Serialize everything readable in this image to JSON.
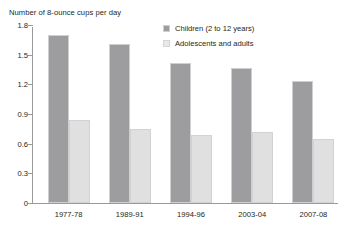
{
  "figure": {
    "cropped_title_remnant": "",
    "axis_title": "Number of 8-ounce cups per day"
  },
  "legend": {
    "position": "top-right",
    "items": [
      {
        "label": "Children (2 to 12 years)",
        "swatch": "legend-swatch-children",
        "color": "#9d9d9f"
      },
      {
        "label": "Adolescents and adults",
        "swatch": "legend-swatch-adolescents-adults",
        "color": "#e8e8e8"
      }
    ]
  },
  "chart_data": {
    "type": "bar",
    "title": "",
    "subtitle": "",
    "xlabel": "",
    "ylabel": "Number of 8-ounce cups per day",
    "categories": [
      "1977-78",
      "1989-91",
      "1994-96",
      "2003-04",
      "2007-08"
    ],
    "series": [
      {
        "name": "Children (2 to 12 years)",
        "color": "#9d9d9f",
        "values": [
          1.7,
          1.61,
          1.42,
          1.37,
          1.23
        ]
      },
      {
        "name": "Adolescents and adults",
        "color": "#e0e0e0",
        "values": [
          0.84,
          0.75,
          0.69,
          0.72,
          0.65
        ]
      }
    ],
    "ylim": [
      0,
      1.8
    ],
    "yticks": [
      0,
      0.3,
      0.6,
      0.9,
      1.2,
      1.5,
      1.8
    ],
    "ytick_labels": [
      "0",
      "0.3",
      "0.6",
      "0.9",
      "1.2",
      "1.5",
      "1.8"
    ],
    "grid": false,
    "legend_position": "top-right"
  },
  "colors": {
    "axis": "#9a9a9c",
    "text": "#231f20",
    "series_1": "#9d9d9f",
    "series_2": "#e0e0e0",
    "background": "#ffffff"
  }
}
